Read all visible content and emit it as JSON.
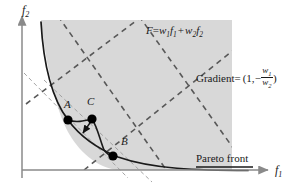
{
  "figure": {
    "title_caption": "",
    "axes": {
      "x_label": "f",
      "x_sub": "1",
      "y_label": "f",
      "y_sub": "2",
      "x_axis_y": 170,
      "y_axis_x": 22,
      "axis_color": "#8a8a8a"
    },
    "annotations": {
      "objective_prefix": "F",
      "objective_eq": "=",
      "objective_w1": "w",
      "objective_w1_sub": "1",
      "objective_f1": "f",
      "objective_f1_sub": "1",
      "objective_plus": "+",
      "objective_w2": "w",
      "objective_w2_sub": "2",
      "objective_f2": "f",
      "objective_f2_sub": "2",
      "objective_full_text": "F = w1f1 + w2f2",
      "gradient_word": "Gradient",
      "gradient_eq": "=",
      "gradient_open": "(1,",
      "gradient_minus": "−",
      "gradient_num": "w",
      "gradient_num_sub": "1",
      "gradient_den": "w",
      "gradient_den_sub": "2",
      "gradient_close": ")",
      "gradient_full_text": "Gradient = (1, -w1/w2)",
      "pareto_front": "Pareto front"
    },
    "points": [
      {
        "id": "A",
        "label": "A",
        "cx": 68,
        "cy": 120,
        "r": 4.6
      },
      {
        "id": "C",
        "label": "C",
        "cx": 92,
        "cy": 119,
        "r": 4.6
      },
      {
        "id": "B",
        "label": "B",
        "cx": 113,
        "cy": 155,
        "r": 4.6
      }
    ],
    "point_label_positions": [
      {
        "id": "A",
        "x": 66,
        "y": 103
      },
      {
        "id": "C",
        "x": 88,
        "y": 100
      },
      {
        "id": "B",
        "x": 120,
        "y": 139
      }
    ],
    "colors": {
      "feasible_region_fill": "#d8d8d8",
      "curve_stroke": "#1a1a1a",
      "dashed_thick": "#555555",
      "dashed_thin": "#9a9a9a",
      "point_fill": "#000000",
      "text": "#1a1a1a",
      "background": "#ffffff"
    },
    "feasible_region": {
      "top_y": 20,
      "right_x": 232,
      "description": "shaded attainable objective space bounded by Pareto front"
    },
    "pareto_curve_path": "M 41,26 C 44,60 52,96 68,120 C 78,134 96,147 118,157 C 150,168 195,170 245,170",
    "dashed_lines_thick": [
      {
        "x1": 60,
        "y1": 20,
        "x2": 170,
        "y2": 175
      },
      {
        "x1": 140,
        "y1": 20,
        "x2": 232,
        "y2": 140
      },
      {
        "x1": 28,
        "y1": 108,
        "x2": 140,
        "y2": 20
      },
      {
        "x1": 86,
        "y1": 165,
        "x2": 232,
        "y2": 52
      }
    ],
    "dashed_lines_thin": [
      {
        "x1": 24,
        "y1": 73,
        "x2": 128,
        "y2": 178
      },
      {
        "x1": 42,
        "y1": 80,
        "x2": 152,
        "y2": 180
      }
    ],
    "arrow": {
      "from_x": 92,
      "from_y": 121,
      "to_x": 82,
      "to_y": 134,
      "label": "descent-direction-arrow"
    },
    "pareto_underline": {
      "x1": 196,
      "y1": 168,
      "x2": 253,
      "y2": 168
    }
  }
}
